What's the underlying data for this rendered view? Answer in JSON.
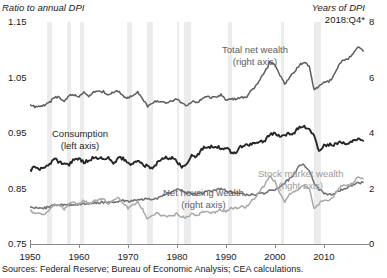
{
  "axes": {
    "left_title": "Ratio to annual DPI",
    "right_title": "Years of DPI",
    "right_date": "2018:Q4*",
    "y_left_ticks": [
      "1.15",
      "1.05",
      "0.95",
      "0.85",
      "0.75"
    ],
    "y_right_ticks": [
      "8",
      "6",
      "4",
      "2",
      "0"
    ],
    "x_ticks": [
      "1950",
      "1960",
      "1970",
      "1980",
      "1990",
      "2000",
      "2010"
    ]
  },
  "labels": {
    "total_net_wealth": "Total net wealth",
    "total_net_wealth_axis": "(right axis)",
    "consumption": "Consumption",
    "consumption_axis": "(left axis)",
    "net_housing_wealth": "Net housing wealth",
    "net_housing_wealth_axis": "(right axis)",
    "stock_market_wealth": "Stock market wealth",
    "stock_market_wealth_axis": "(right axis)"
  },
  "source_note": "Sources: Federal Reserve; Bureau of Economic Analysis; CEA calculations.",
  "colors": {
    "consumption": "#262626",
    "total_net_wealth": "#5d5d5d",
    "net_housing_wealth": "#6f6f6f",
    "stock_market_wealth": "#a8a8a8",
    "recession_band": "#ececec",
    "axis": "#8a8a8a"
  },
  "chart_data": {
    "type": "line",
    "title": "",
    "subtitle": "",
    "xlabel": "",
    "ylabel": "Ratio to annual DPI",
    "ylabel_right": "Years of DPI",
    "xlim": [
      1950,
      2019
    ],
    "ylim": [
      0.75,
      1.15
    ],
    "ylim_right": [
      0,
      8
    ],
    "grid": false,
    "legend": "inline-annotations",
    "note": "Left axis is the consumption series (ratio to annual DPI); right axis is the three wealth series (years of DPI).",
    "x": [
      1950,
      1951,
      1952,
      1953,
      1954,
      1955,
      1956,
      1957,
      1958,
      1959,
      1960,
      1961,
      1962,
      1963,
      1964,
      1965,
      1966,
      1967,
      1968,
      1969,
      1970,
      1971,
      1972,
      1973,
      1974,
      1975,
      1976,
      1977,
      1978,
      1979,
      1980,
      1981,
      1982,
      1983,
      1984,
      1985,
      1986,
      1987,
      1988,
      1989,
      1990,
      1991,
      1992,
      1993,
      1994,
      1995,
      1996,
      1997,
      1998,
      1999,
      2000,
      2001,
      2002,
      2003,
      2004,
      2005,
      2006,
      2007,
      2008,
      2009,
      2010,
      2011,
      2012,
      2013,
      2014,
      2015,
      2016,
      2017,
      2018
    ],
    "series": [
      {
        "name": "Consumption",
        "axis": "left",
        "unit": "ratio to annual DPI",
        "color": "#262626",
        "values": [
          0.882,
          0.889,
          0.884,
          0.888,
          0.892,
          0.903,
          0.897,
          0.896,
          0.893,
          0.903,
          0.903,
          0.897,
          0.901,
          0.906,
          0.905,
          0.904,
          0.906,
          0.895,
          0.904,
          0.904,
          0.894,
          0.893,
          0.901,
          0.893,
          0.89,
          0.885,
          0.896,
          0.906,
          0.905,
          0.906,
          0.898,
          0.89,
          0.893,
          0.91,
          0.906,
          0.921,
          0.925,
          0.925,
          0.925,
          0.923,
          0.923,
          0.916,
          0.915,
          0.925,
          0.929,
          0.929,
          0.932,
          0.934,
          0.937,
          0.948,
          0.95,
          0.945,
          0.946,
          0.949,
          0.951,
          0.962,
          0.962,
          0.958,
          0.945,
          0.918,
          0.927,
          0.929,
          0.928,
          0.933,
          0.932,
          0.929,
          0.936,
          0.938,
          0.936
        ]
      },
      {
        "name": "Total net wealth",
        "axis": "right",
        "unit": "years of DPI",
        "color": "#5d5d5d",
        "values": [
          5.05,
          4.95,
          4.98,
          5.0,
          5.1,
          5.28,
          5.3,
          5.15,
          5.35,
          5.38,
          5.3,
          5.45,
          5.35,
          5.45,
          5.48,
          5.5,
          5.35,
          5.48,
          5.52,
          5.32,
          5.25,
          5.35,
          5.48,
          5.25,
          4.95,
          5.1,
          5.15,
          5.12,
          5.1,
          5.15,
          5.22,
          5.05,
          5.02,
          5.12,
          5.08,
          5.2,
          5.32,
          5.28,
          5.3,
          5.38,
          5.2,
          5.25,
          5.22,
          5.3,
          5.25,
          5.48,
          5.65,
          5.95,
          6.2,
          6.55,
          6.45,
          6.1,
          5.75,
          6.0,
          6.2,
          6.45,
          6.55,
          6.4,
          5.55,
          5.7,
          5.8,
          5.85,
          6.05,
          6.45,
          6.65,
          6.7,
          6.85,
          7.1,
          6.95
        ]
      },
      {
        "name": "Net housing wealth",
        "axis": "right",
        "unit": "years of DPI",
        "color": "#6f6f6f",
        "values": [
          1.38,
          1.3,
          1.28,
          1.3,
          1.33,
          1.4,
          1.42,
          1.4,
          1.42,
          1.43,
          1.42,
          1.45,
          1.45,
          1.48,
          1.48,
          1.5,
          1.48,
          1.5,
          1.55,
          1.55,
          1.52,
          1.58,
          1.62,
          1.62,
          1.6,
          1.62,
          1.65,
          1.75,
          1.82,
          1.9,
          1.95,
          1.92,
          1.85,
          1.82,
          1.8,
          1.82,
          1.88,
          1.92,
          1.95,
          1.98,
          1.92,
          1.88,
          1.82,
          1.8,
          1.78,
          1.78,
          1.78,
          1.8,
          1.85,
          1.92,
          1.95,
          2.05,
          2.2,
          2.35,
          2.55,
          2.8,
          2.85,
          2.65,
          2.2,
          1.95,
          1.85,
          1.78,
          1.8,
          1.92,
          2.0,
          2.05,
          2.12,
          2.2,
          2.22
        ]
      },
      {
        "name": "Stock market wealth",
        "axis": "right",
        "unit": "years of DPI",
        "color": "#a8a8a8",
        "values": [
          1.2,
          1.12,
          1.1,
          1.05,
          1.25,
          1.42,
          1.42,
          1.25,
          1.45,
          1.5,
          1.42,
          1.58,
          1.45,
          1.55,
          1.6,
          1.62,
          1.45,
          1.6,
          1.68,
          1.45,
          1.3,
          1.4,
          1.52,
          1.25,
          0.9,
          1.05,
          1.12,
          1.02,
          0.98,
          1.0,
          1.1,
          0.98,
          0.98,
          1.08,
          1.02,
          1.12,
          1.2,
          1.15,
          1.15,
          1.25,
          1.15,
          1.28,
          1.3,
          1.35,
          1.3,
          1.5,
          1.68,
          1.95,
          2.15,
          2.45,
          2.25,
          1.85,
          1.48,
          1.8,
          1.9,
          2.0,
          2.1,
          2.0,
          1.25,
          1.45,
          1.6,
          1.58,
          1.72,
          2.02,
          2.15,
          2.1,
          2.2,
          2.45,
          2.35
        ]
      }
    ],
    "recession_bands": [
      {
        "start": 1953.5,
        "end": 1954.4
      },
      {
        "start": 1957.6,
        "end": 1958.3
      },
      {
        "start": 1960.3,
        "end": 1961.1
      },
      {
        "start": 1969.9,
        "end": 1970.9
      },
      {
        "start": 1973.9,
        "end": 1975.2
      },
      {
        "start": 1980.0,
        "end": 1980.5
      },
      {
        "start": 1981.5,
        "end": 1982.9
      },
      {
        "start": 1990.5,
        "end": 1991.2
      },
      {
        "start": 2001.2,
        "end": 2001.8
      },
      {
        "start": 2007.9,
        "end": 2009.4
      }
    ]
  }
}
